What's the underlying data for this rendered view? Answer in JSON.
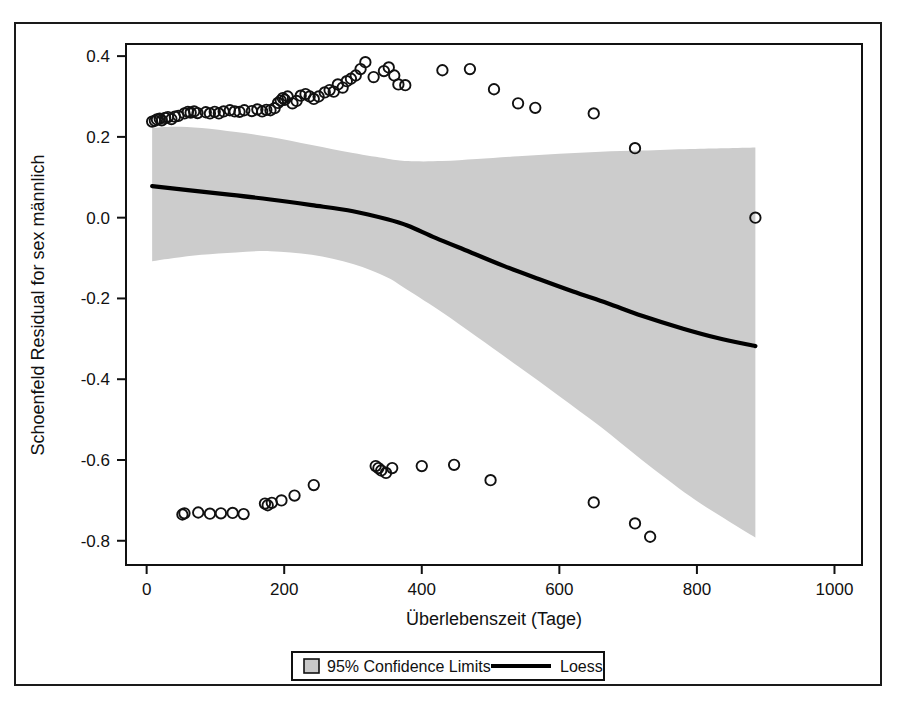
{
  "chart_data": {
    "type": "scatter",
    "title": "",
    "xlabel": "Überlebenszeit (Tage)",
    "ylabel": "Schoenfeld Residual for sex männlich",
    "xlim": [
      -30,
      1040
    ],
    "ylim": [
      -0.86,
      0.43
    ],
    "xticks": [
      0,
      200,
      400,
      600,
      800,
      1000
    ],
    "xtick_labels": [
      "0",
      "200",
      "400",
      "600",
      "800",
      "1000"
    ],
    "yticks": [
      0.4,
      0.2,
      0.0,
      -0.2,
      -0.4,
      -0.6,
      -0.8
    ],
    "ytick_labels": [
      "0.4",
      "0.2",
      "0.0",
      "-0.2",
      "-0.4",
      "-0.6",
      "-0.8"
    ],
    "grid": false,
    "legend_position": "bottom-center",
    "legend": [
      {
        "label": "95% Confidence Limits",
        "marker": "filled-square",
        "color": "#c8c8c8"
      },
      {
        "label": "Loess",
        "marker": "line",
        "color": "#000000"
      }
    ],
    "series": [
      {
        "name": "Schoenfeld residuals (upper group)",
        "type": "scatter",
        "marker": "open-circle",
        "points": [
          [
            8,
            0.238
          ],
          [
            12,
            0.24
          ],
          [
            15,
            0.243
          ],
          [
            19,
            0.245
          ],
          [
            22,
            0.241
          ],
          [
            27,
            0.247
          ],
          [
            31,
            0.249
          ],
          [
            36,
            0.244
          ],
          [
            41,
            0.25
          ],
          [
            46,
            0.252
          ],
          [
            55,
            0.258
          ],
          [
            60,
            0.262
          ],
          [
            64,
            0.26
          ],
          [
            69,
            0.263
          ],
          [
            74,
            0.259
          ],
          [
            86,
            0.261
          ],
          [
            92,
            0.258
          ],
          [
            99,
            0.262
          ],
          [
            105,
            0.258
          ],
          [
            112,
            0.263
          ],
          [
            121,
            0.266
          ],
          [
            128,
            0.263
          ],
          [
            135,
            0.262
          ],
          [
            142,
            0.266
          ],
          [
            153,
            0.264
          ],
          [
            161,
            0.268
          ],
          [
            168,
            0.263
          ],
          [
            174,
            0.267
          ],
          [
            180,
            0.266
          ],
          [
            186,
            0.271
          ],
          [
            191,
            0.284
          ],
          [
            195,
            0.29
          ],
          [
            198,
            0.296
          ],
          [
            201,
            0.292
          ],
          [
            205,
            0.3
          ],
          [
            212,
            0.283
          ],
          [
            218,
            0.289
          ],
          [
            224,
            0.302
          ],
          [
            231,
            0.306
          ],
          [
            237,
            0.3
          ],
          [
            243,
            0.294
          ],
          [
            250,
            0.3
          ],
          [
            259,
            0.31
          ],
          [
            266,
            0.316
          ],
          [
            272,
            0.312
          ],
          [
            278,
            0.33
          ],
          [
            285,
            0.322
          ],
          [
            291,
            0.338
          ],
          [
            297,
            0.344
          ],
          [
            304,
            0.352
          ],
          [
            311,
            0.368
          ],
          [
            318,
            0.385
          ],
          [
            330,
            0.348
          ],
          [
            345,
            0.363
          ],
          [
            352,
            0.372
          ],
          [
            360,
            0.352
          ],
          [
            366,
            0.33
          ],
          [
            376,
            0.328
          ],
          [
            430,
            0.365
          ],
          [
            470,
            0.368
          ],
          [
            505,
            0.318
          ],
          [
            540,
            0.283
          ],
          [
            565,
            0.272
          ],
          [
            650,
            0.258
          ],
          [
            710,
            0.172
          ],
          [
            885,
            0.0
          ]
        ]
      },
      {
        "name": "Schoenfeld residuals (lower group)",
        "type": "scatter",
        "marker": "open-circle",
        "points": [
          [
            52,
            -0.735
          ],
          [
            55,
            -0.732
          ],
          [
            75,
            -0.73
          ],
          [
            92,
            -0.733
          ],
          [
            108,
            -0.732
          ],
          [
            125,
            -0.731
          ],
          [
            141,
            -0.734
          ],
          [
            172,
            -0.708
          ],
          [
            176,
            -0.712
          ],
          [
            182,
            -0.706
          ],
          [
            196,
            -0.7
          ],
          [
            215,
            -0.688
          ],
          [
            243,
            -0.662
          ],
          [
            333,
            -0.615
          ],
          [
            337,
            -0.62
          ],
          [
            341,
            -0.626
          ],
          [
            348,
            -0.632
          ],
          [
            357,
            -0.62
          ],
          [
            400,
            -0.615
          ],
          [
            447,
            -0.612
          ],
          [
            500,
            -0.65
          ],
          [
            650,
            -0.705
          ],
          [
            710,
            -0.757
          ],
          [
            732,
            -0.79
          ]
        ]
      },
      {
        "name": "Loess",
        "type": "line",
        "color": "#000000",
        "points": [
          [
            8,
            0.078
          ],
          [
            60,
            0.068
          ],
          [
            120,
            0.057
          ],
          [
            180,
            0.045
          ],
          [
            240,
            0.031
          ],
          [
            300,
            0.016
          ],
          [
            350,
            -0.004
          ],
          [
            380,
            -0.02
          ],
          [
            420,
            -0.05
          ],
          [
            470,
            -0.085
          ],
          [
            520,
            -0.12
          ],
          [
            570,
            -0.152
          ],
          [
            620,
            -0.183
          ],
          [
            670,
            -0.212
          ],
          [
            720,
            -0.243
          ],
          [
            780,
            -0.275
          ],
          [
            830,
            -0.298
          ],
          [
            885,
            -0.318
          ]
        ]
      },
      {
        "name": "95% Confidence Limits",
        "type": "band",
        "color": "#cccccc",
        "upper": [
          [
            8,
            0.222
          ],
          [
            40,
            0.225
          ],
          [
            80,
            0.222
          ],
          [
            130,
            0.212
          ],
          [
            180,
            0.2
          ],
          [
            240,
            0.18
          ],
          [
            300,
            0.16
          ],
          [
            350,
            0.146
          ],
          [
            380,
            0.14
          ],
          [
            430,
            0.14
          ],
          [
            480,
            0.145
          ],
          [
            540,
            0.152
          ],
          [
            600,
            0.158
          ],
          [
            660,
            0.163
          ],
          [
            720,
            0.166
          ],
          [
            790,
            0.17
          ],
          [
            840,
            0.172
          ],
          [
            885,
            0.174
          ]
        ],
        "lower": [
          [
            8,
            -0.108
          ],
          [
            40,
            -0.1
          ],
          [
            80,
            -0.092
          ],
          [
            130,
            -0.086
          ],
          [
            180,
            -0.083
          ],
          [
            240,
            -0.092
          ],
          [
            300,
            -0.115
          ],
          [
            350,
            -0.148
          ],
          [
            380,
            -0.18
          ],
          [
            430,
            -0.235
          ],
          [
            480,
            -0.295
          ],
          [
            540,
            -0.368
          ],
          [
            600,
            -0.442
          ],
          [
            660,
            -0.518
          ],
          [
            720,
            -0.6
          ],
          [
            790,
            -0.69
          ],
          [
            840,
            -0.745
          ],
          [
            885,
            -0.792
          ]
        ]
      }
    ]
  }
}
